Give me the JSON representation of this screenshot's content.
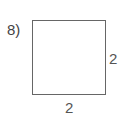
{
  "problem": {
    "number_label": "8)"
  },
  "shape": {
    "type": "square",
    "side_right_label": "2",
    "side_bottom_label": "2",
    "stroke_color": "#666666",
    "label_color": "#555555"
  }
}
